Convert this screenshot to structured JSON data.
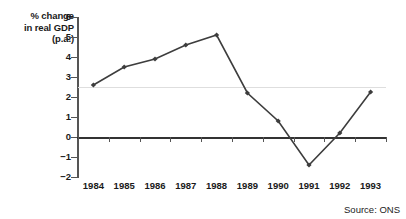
{
  "chart_data": {
    "type": "line",
    "title": "",
    "subtitle": "",
    "xlabel": "",
    "ylabel": "% change in real GDP (p.a.)",
    "ylabel_lines": [
      "% change",
      "in real GDP",
      "(p.a.)"
    ],
    "categories": [
      "1984",
      "1985",
      "1986",
      "1987",
      "1988",
      "1989",
      "1990",
      "1991",
      "1992",
      "1993"
    ],
    "values": [
      2.6,
      3.5,
      3.9,
      4.6,
      5.1,
      2.2,
      0.8,
      -1.4,
      0.2,
      2.25
    ],
    "series": [
      {
        "name": "% change in real GDP (p.a.)",
        "values": [
          2.6,
          3.5,
          3.9,
          4.6,
          5.1,
          2.2,
          0.8,
          -1.4,
          0.2,
          2.25
        ]
      }
    ],
    "ylim": [
      -2,
      6
    ],
    "yticks": [
      6,
      5,
      4,
      3,
      2,
      1,
      0,
      -1,
      -2
    ],
    "ytick_labels": [
      "6",
      "5",
      "4",
      "3",
      "2",
      "1",
      "0",
      "−1",
      "−2"
    ],
    "grid": true,
    "gridlines": [
      2.5
    ],
    "zero_line": 0,
    "legend": "none",
    "legend_position": "none",
    "marker": "filled-diamond",
    "line_color": "#3d3d3d",
    "marker_color": "#3d3d3d",
    "axis_color": "#555555",
    "gridline_color": "#dedede",
    "background_color": "#ffffff",
    "annotations": []
  },
  "footer": {
    "source_label": "Source: ONS"
  }
}
